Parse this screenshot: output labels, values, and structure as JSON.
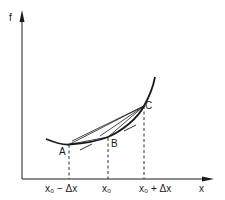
{
  "diagram": {
    "axes": {
      "y_label": "f",
      "x_label": "x"
    },
    "points": [
      {
        "id": "A",
        "label": "A"
      },
      {
        "id": "B",
        "label": "B"
      },
      {
        "id": "C",
        "label": "C"
      }
    ],
    "x_ticks": [
      {
        "label": "x₀ − Δx"
      },
      {
        "label": "x₀"
      },
      {
        "label": "x₀ + Δx"
      }
    ],
    "colors": {
      "ink": "#1a1a1a",
      "background": "#ffffff"
    }
  }
}
